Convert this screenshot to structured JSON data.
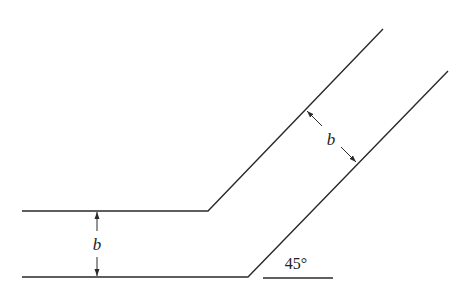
{
  "diagram": {
    "type": "channel-bend",
    "colors": {
      "line": "#2a2a2a",
      "background": "#ffffff"
    },
    "labels": {
      "width_horizontal": "b",
      "width_inclined": "b",
      "angle": "45°"
    },
    "geometry": {
      "upper_wall": [
        [
          22,
          211
        ],
        [
          208,
          211
        ],
        [
          383,
          29
        ]
      ],
      "lower_wall": [
        [
          22,
          277
        ],
        [
          248,
          277
        ],
        [
          448,
          71
        ]
      ],
      "angle_reference_line": [
        [
          263,
          278
        ],
        [
          333,
          278
        ]
      ],
      "dimension_horizontal": {
        "x": 97,
        "y_top": 211,
        "y_bottom": 277
      },
      "dimension_inclined": {
        "from": [
          306,
          110
        ],
        "to": [
          357,
          163
        ]
      }
    }
  }
}
